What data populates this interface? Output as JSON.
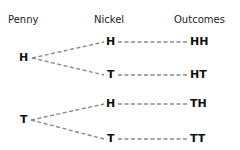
{
  "headers": {
    "penny": "Penny",
    "nickel": "Nickel",
    "outcomes": "Outcomes"
  },
  "tree": {
    "penny": [
      {
        "label": "H",
        "nickel": [
          {
            "label": "H",
            "outcome": "HH"
          },
          {
            "label": "T",
            "outcome": "HT"
          }
        ]
      },
      {
        "label": "T",
        "nickel": [
          {
            "label": "H",
            "outcome": "TH"
          },
          {
            "label": "T",
            "outcome": "TT"
          }
        ]
      }
    ]
  },
  "colors": {
    "line": "#8a8a8a",
    "text": "#111111"
  }
}
